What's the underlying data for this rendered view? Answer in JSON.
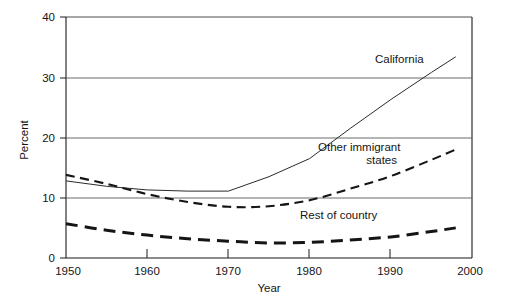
{
  "chart_data": {
    "type": "line",
    "title": "",
    "xlabel": "Year",
    "ylabel": "Percent",
    "xlim": [
      1950,
      2000
    ],
    "ylim": [
      0,
      40
    ],
    "xticks": [
      1950,
      1960,
      1970,
      1980,
      1990,
      2000
    ],
    "xtick_labels": [
      "1950",
      "1960",
      "1970",
      "1980",
      "1990",
      "2000"
    ],
    "yticks": [
      0,
      10,
      20,
      30,
      40
    ],
    "ytick_labels": [
      "0",
      "10",
      "20",
      "30",
      "40"
    ],
    "grid": "horizontal",
    "legend": "inline-annotations",
    "series": [
      {
        "name": "California",
        "label": "California",
        "style": "solid-thin",
        "color": "#2b2b2b",
        "x": [
          1950,
          1955,
          1960,
          1965,
          1970,
          1975,
          1980,
          1985,
          1990,
          1995,
          1998
        ],
        "values": [
          12.8,
          11.9,
          11.3,
          11.1,
          11.1,
          13.5,
          16.5,
          21.5,
          26.3,
          30.8,
          33.4
        ]
      },
      {
        "name": "Other immigrant states",
        "label_line1": "Other immigrant",
        "label_line2": "states",
        "style": "dashed-medium",
        "color": "#151515",
        "x": [
          1950,
          1955,
          1960,
          1965,
          1970,
          1975,
          1980,
          1985,
          1990,
          1995,
          1998
        ],
        "values": [
          13.8,
          12.3,
          10.6,
          9.3,
          8.5,
          8.6,
          9.6,
          11.5,
          13.6,
          16.3,
          18.0
        ]
      },
      {
        "name": "Rest of country",
        "label": "Rest of country",
        "style": "dashed-thick",
        "color": "#151515",
        "x": [
          1950,
          1955,
          1960,
          1965,
          1970,
          1975,
          1980,
          1985,
          1990,
          1995,
          1998
        ],
        "values": [
          5.7,
          4.6,
          3.8,
          3.2,
          2.8,
          2.5,
          2.6,
          3.0,
          3.5,
          4.4,
          5.0
        ]
      }
    ],
    "annotations": [
      {
        "text": "California",
        "x": 1987.5,
        "y": 31.6
      },
      {
        "text": "Other immigrant",
        "x": 1985.5,
        "y": 17.2
      },
      {
        "text": "states",
        "x": 1985.5,
        "y": 15.2
      },
      {
        "text": "Rest of country",
        "x": 1978.5,
        "y": 6.6
      }
    ]
  }
}
